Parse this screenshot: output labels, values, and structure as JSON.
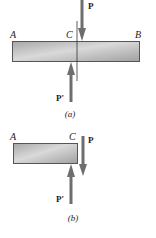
{
  "figure_a": {
    "caption": "(a)",
    "labels": {
      "A": "A",
      "B": "B",
      "C": "C",
      "P": "P",
      "P_prime": "P'"
    }
  },
  "figure_b": {
    "caption": "(b)",
    "labels": {
      "A": "A",
      "C": "C",
      "P": "P",
      "P_prime": "P'"
    }
  },
  "colors": {
    "bar_fill_light": "#d8d8d8",
    "bar_fill_dark": "#9c9c9c",
    "bar_stroke": "#555555",
    "arrow": "#6e6e6e",
    "text": "#222222"
  }
}
